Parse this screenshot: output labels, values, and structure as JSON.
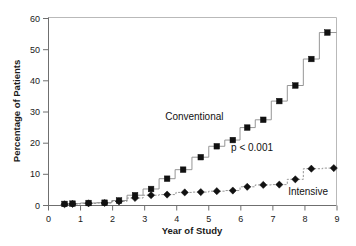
{
  "chart_data": {
    "type": "line",
    "title": "",
    "subtitle": "",
    "xlabel": "Year of Study",
    "ylabel": "Percentage of Patients",
    "xlim": [
      0,
      9.3
    ],
    "ylim": [
      0,
      60
    ],
    "xticks": [
      0,
      1,
      2,
      3,
      4,
      5,
      6,
      7,
      8,
      9
    ],
    "xticklabels": [
      "0",
      "1",
      "2",
      "3",
      "4",
      "5",
      "6",
      "7",
      "8",
      "9"
    ],
    "yticks": [
      0,
      10,
      20,
      30,
      40,
      50,
      60
    ],
    "yticklabels": [
      "0",
      "10",
      "20",
      "30",
      "40",
      "50",
      "60"
    ],
    "grid": false,
    "legend_position": "inline-annotations",
    "annotations": [
      {
        "text": "Conventional",
        "x": 4.55,
        "y": 27.5
      },
      {
        "text": "p < 0.001",
        "x": 6.35,
        "y": 17.5
      },
      {
        "text": "Intensive",
        "x": 8.1,
        "y": 3.5
      }
    ],
    "series": [
      {
        "name": "Conventional",
        "marker": "square",
        "linestyle": "step-solid",
        "x": [
          0.5,
          0.75,
          1.25,
          1.75,
          2.2,
          2.7,
          3.2,
          3.7,
          4.2,
          4.75,
          5.25,
          5.75,
          6.2,
          6.7,
          7.2,
          7.7,
          8.2,
          8.7
        ],
        "y": [
          0.5,
          0.6,
          0.8,
          0.9,
          1.6,
          3.3,
          5.3,
          8.6,
          11.5,
          15.5,
          19.0,
          21.0,
          25.0,
          27.5,
          33.5,
          38.5,
          47.0,
          55.5
        ]
      },
      {
        "name": "Intensive",
        "marker": "diamond",
        "linestyle": "step-dashed",
        "x": [
          0.5,
          0.75,
          1.25,
          1.75,
          2.2,
          2.7,
          3.2,
          3.7,
          4.25,
          4.75,
          5.25,
          5.75,
          6.2,
          6.7,
          7.2,
          7.7,
          8.2,
          8.9
        ],
        "y": [
          0.4,
          0.5,
          0.7,
          0.8,
          1.3,
          2.4,
          3.3,
          3.5,
          4.2,
          4.3,
          4.6,
          4.8,
          6.0,
          6.6,
          6.7,
          8.4,
          11.8,
          12.0
        ]
      }
    ]
  },
  "figure": {
    "background_color": "#ffffff",
    "axis_color": "#6f6f6f",
    "marker_color": "#111111",
    "line_color": "#8a8a8a"
  }
}
